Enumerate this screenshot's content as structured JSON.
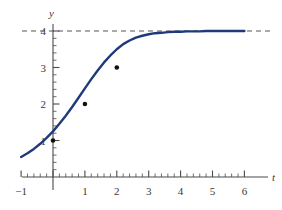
{
  "chart_data": {
    "type": "line",
    "title": "",
    "xlabel": "t",
    "ylabel": "y",
    "xlim": [
      -1,
      6
    ],
    "ylim": [
      0,
      4.35
    ],
    "grid": false,
    "legend": "none",
    "x_ticks": [
      -1,
      0,
      1,
      2,
      3,
      4,
      5,
      6
    ],
    "x_tick_labels": [
      "−1",
      "",
      "1",
      "2",
      "3",
      "4",
      "5",
      "6"
    ],
    "y_ticks": [
      1,
      2,
      3,
      4
    ],
    "y_tick_labels": [
      "1",
      "2",
      "3",
      "4"
    ],
    "minor_tick_step": 0.2,
    "series": [
      {
        "name": "logistic curve",
        "color": "#1f3a7a",
        "equation": "y = 4/(1 + 3e^(-t))",
        "x": [
          -1.0,
          -0.8,
          -0.6,
          -0.4,
          -0.2,
          0.0,
          0.2,
          0.4,
          0.6,
          0.8,
          1.0,
          1.2,
          1.4,
          1.6,
          1.8,
          2.0,
          2.2,
          2.4,
          2.6,
          2.8,
          3.0,
          3.2,
          3.4,
          3.6,
          3.8,
          4.0,
          4.2,
          4.4,
          4.6,
          4.8,
          5.0,
          5.2,
          5.4,
          5.6,
          5.8,
          6.0
        ],
        "y": [
          0.55,
          0.65,
          0.77,
          0.91,
          1.07,
          1.25,
          1.46,
          1.68,
          1.92,
          2.17,
          2.43,
          2.68,
          2.92,
          3.14,
          3.33,
          3.5,
          3.64,
          3.74,
          3.82,
          3.87,
          3.91,
          3.94,
          3.95,
          3.97,
          3.98,
          3.98,
          3.99,
          3.99,
          3.99,
          4.0,
          4.0,
          4.0,
          4.0,
          4.0,
          4.0,
          4.0
        ]
      }
    ],
    "markers": [
      {
        "label": "(0, 1)",
        "x": 0,
        "y": 1
      },
      {
        "label": "(1, 2)",
        "x": 1,
        "y": 2
      },
      {
        "label": "(2, 3)",
        "x": 2,
        "y": 3
      }
    ],
    "asymptote": {
      "value": 4,
      "style": "dashed",
      "color": "#555555",
      "orientation": "horizontal"
    },
    "colors": {
      "curve": "#1f3a7a",
      "axis": "#4a4a4a",
      "marker": "#111111",
      "asymptote": "#555555",
      "background": "#ffffff"
    }
  }
}
